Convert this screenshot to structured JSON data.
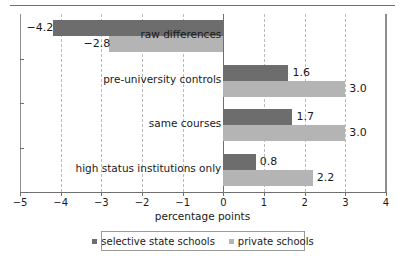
{
  "chart_data": {
    "type": "bar",
    "orientation": "horizontal",
    "title": "",
    "xlabel": "percentage points",
    "ylabel": "",
    "xlim": [
      -5,
      4
    ],
    "xticks": [
      "−5",
      "−4",
      "−3",
      "−2",
      "−1",
      "0",
      "1",
      "2",
      "3",
      "4"
    ],
    "xtick_values": [
      -5,
      -4,
      -3,
      -2,
      -1,
      0,
      1,
      2,
      3,
      4
    ],
    "grid": "vertical-dashed",
    "legend_position": "bottom-center",
    "categories": [
      "raw differences",
      "pre-university controls",
      "same courses",
      "high status institutions only"
    ],
    "series": [
      {
        "name": "selective state schools",
        "color": "#6d6d6d",
        "values": [
          -4.2,
          1.6,
          1.7,
          0.8
        ],
        "labels": [
          "−4.2",
          "1.6",
          "1.7",
          "0.8"
        ]
      },
      {
        "name": "private schools",
        "color": "#b4b4b4",
        "values": [
          -2.8,
          3.0,
          3.0,
          2.2
        ],
        "labels": [
          "−2.8",
          "3.0",
          "3.0",
          "2.2"
        ]
      }
    ]
  },
  "legend": {
    "items": [
      {
        "label": "selective state schools",
        "swatch": "dark"
      },
      {
        "label": "private schools",
        "swatch": "light"
      }
    ]
  }
}
